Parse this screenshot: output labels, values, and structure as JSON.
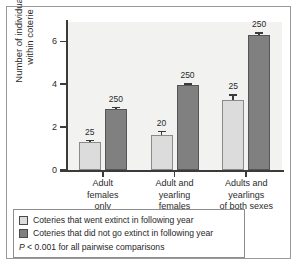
{
  "chart_data": {
    "type": "bar",
    "title": "",
    "xlabel": "",
    "ylabel": "Number of individuals within coterie",
    "ylabel_line1": "Number of individuals",
    "ylabel_line2": "within coterie",
    "ylim": [
      0,
      6.9
    ],
    "yticks": [
      0,
      2,
      4,
      6
    ],
    "ytick_labels": [
      "0",
      "2",
      "4",
      "6"
    ],
    "grid": false,
    "legend_position": "below-plot",
    "categories": [
      "Adult females only",
      "Adult and yearling females",
      "Adults and yearlings of both sexes"
    ],
    "category_lines": [
      [
        "Adult",
        "females",
        "only"
      ],
      [
        "Adult and",
        "yearling",
        "females"
      ],
      [
        "Adults and",
        "yearlings",
        "of both sexes"
      ]
    ],
    "series": [
      {
        "name": "Coteries that went extinct in following year",
        "color": "#dcdcdc",
        "values": [
          1.3,
          1.62,
          3.25
        ],
        "errors": [
          0.12,
          0.22,
          0.28
        ],
        "sample_sizes": [
          "25",
          "20",
          "25"
        ]
      },
      {
        "name": "Coteries that did not go extinct in following year",
        "color": "#808080",
        "values": [
          2.85,
          3.95,
          6.3
        ],
        "errors": [
          0.1,
          0.1,
          0.12
        ],
        "sample_sizes": [
          "250",
          "250",
          "250"
        ]
      }
    ],
    "annotations": [
      "P < 0.001 for all pairwise comparisons"
    ]
  },
  "legend": {
    "items": [
      {
        "label": "Coteries that went extinct in following year",
        "swatch": "light"
      },
      {
        "label": "Coteries that did not go extinct in following year",
        "swatch": "dark"
      }
    ],
    "pvalue_italic": "P",
    "pvalue_rest": " < 0.001 for all pairwise comparisons"
  },
  "colors": {
    "light_bar": "#dcdcdc",
    "dark_bar": "#808080",
    "axis": "#3b3b3b",
    "plot_background": "#f2f2f0",
    "figure_background": "#ffffff",
    "border": "#9a9a9a"
  }
}
